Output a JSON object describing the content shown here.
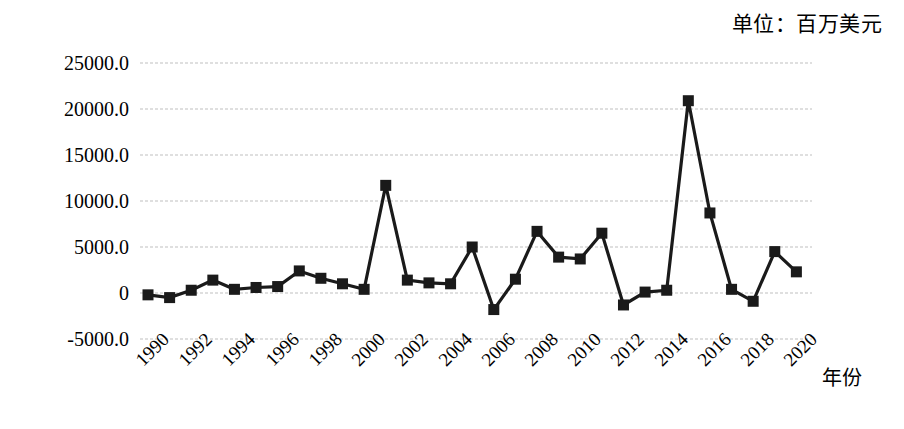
{
  "unit_note": "单位：百万美元",
  "x_axis_title": "年份",
  "chart_data": {
    "type": "line",
    "title": "",
    "subtitle": "",
    "unit_note": "单位：百万美元",
    "xlabel": "年份",
    "ylabel": "",
    "ylim": [
      -5000,
      25000
    ],
    "ytick_step": 5000,
    "ytick_labels": [
      "25000.0",
      "20000.0",
      "15000.0",
      "10000.0",
      "5000.0",
      "0",
      "-5000.0"
    ],
    "ytick_values": [
      25000,
      20000,
      15000,
      10000,
      5000,
      0,
      -5000
    ],
    "xtick_labels": [
      "1990",
      "1992",
      "1994",
      "1996",
      "1998",
      "2000",
      "2002",
      "2004",
      "2006",
      "2008",
      "2010",
      "2012",
      "2014",
      "2016",
      "2018",
      "2020"
    ],
    "xtick_values": [
      1990,
      1992,
      1994,
      1996,
      1998,
      2000,
      2002,
      2004,
      2006,
      2008,
      2010,
      2012,
      2014,
      2016,
      2018,
      2020
    ],
    "grid": true,
    "grid_axis": "y",
    "legend": false,
    "legend_position": "none",
    "marker": "square",
    "line_color": "#1a1a1a",
    "marker_color": "#1a1a1a",
    "grid_color": "#bfbfbf",
    "x": [
      1990,
      1991,
      1992,
      1993,
      1994,
      1995,
      1996,
      1997,
      1998,
      1999,
      2000,
      2001,
      2002,
      2003,
      2004,
      2005,
      2006,
      2007,
      2008,
      2009,
      2010,
      2011,
      2012,
      2013,
      2014,
      2015,
      2016,
      2017,
      2018,
      2019,
      2020
    ],
    "values": [
      -200,
      -500,
      300,
      1400,
      400,
      600,
      700,
      2400,
      1600,
      1000,
      400,
      11700,
      1400,
      1100,
      1000,
      5000,
      -1800,
      1500,
      6700,
      3900,
      3700,
      6500,
      -1300,
      100,
      300,
      20900,
      8700,
      400,
      -900,
      4500,
      2300
    ]
  }
}
